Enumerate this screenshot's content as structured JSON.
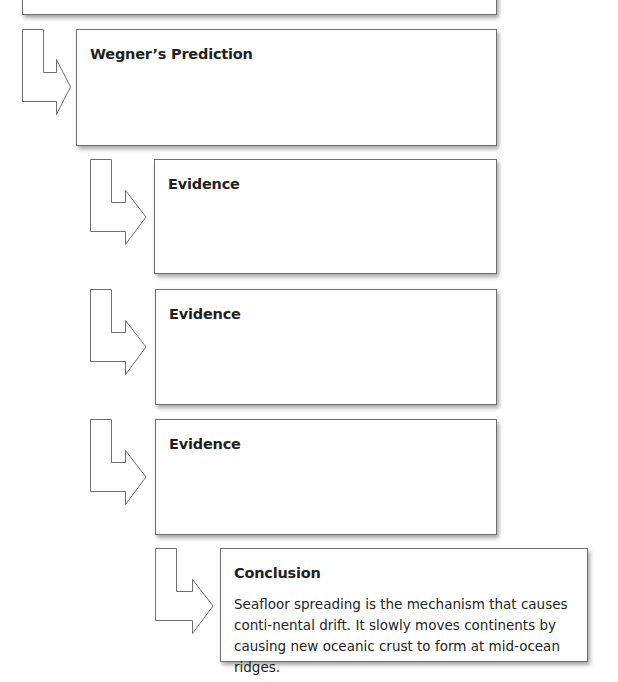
{
  "diagram": {
    "type": "flowchart",
    "stroke_color": "#6d6e70",
    "boxes": [
      {
        "id": "top",
        "title": "",
        "body": ""
      },
      {
        "id": "prediction",
        "title": "Wegner’s Prediction",
        "body": ""
      },
      {
        "id": "evidence1",
        "title": "Evidence",
        "body": ""
      },
      {
        "id": "evidence2",
        "title": "Evidence",
        "body": ""
      },
      {
        "id": "evidence3",
        "title": "Evidence",
        "body": ""
      },
      {
        "id": "conclusion",
        "title": "Conclusion",
        "body": "Seafloor spreading is the mechanism that causes conti-nental drift. It slowly moves continents by causing new oceanic crust to form at mid-ocean ridges."
      }
    ],
    "arrows": [
      {
        "icon": "bent-arrow-right-icon",
        "from": "top",
        "to": "prediction"
      },
      {
        "icon": "bent-arrow-right-icon",
        "from": "prediction",
        "to": "evidence1"
      },
      {
        "icon": "bent-arrow-right-icon",
        "from": "evidence1",
        "to": "evidence2"
      },
      {
        "icon": "bent-arrow-right-icon",
        "from": "evidence2",
        "to": "evidence3"
      },
      {
        "icon": "bent-arrow-right-icon",
        "from": "evidence3",
        "to": "conclusion"
      }
    ]
  }
}
